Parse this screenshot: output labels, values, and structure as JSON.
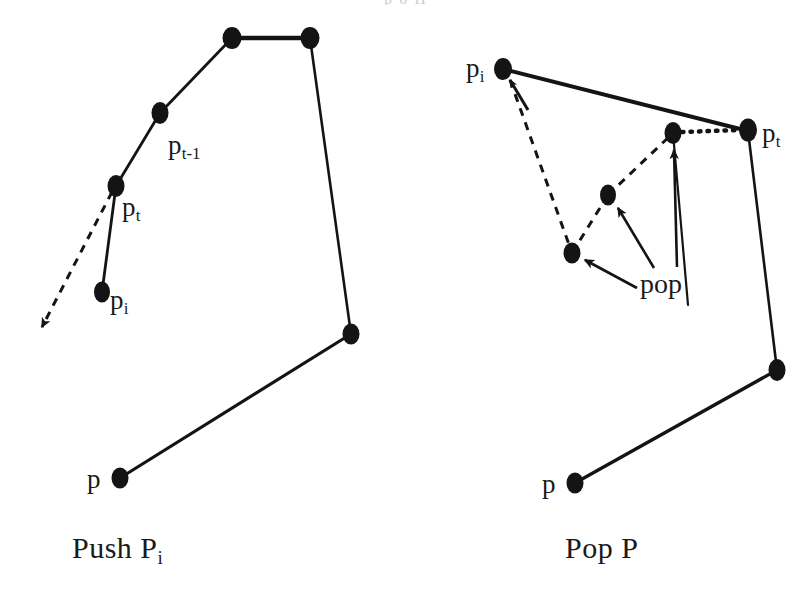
{
  "figure": {
    "type": "geometric-diagram",
    "background_color": "#ffffff",
    "ink_color": "#141414",
    "panels": [
      {
        "id": "push",
        "caption": "Push P",
        "caption_subscript": "i",
        "labels": [
          {
            "id": "p-t-minus-1",
            "base": "p",
            "sub": "t-1"
          },
          {
            "id": "p-t",
            "base": "p",
            "sub": "t"
          },
          {
            "id": "p-i",
            "base": "p",
            "sub": "i"
          },
          {
            "id": "p",
            "base": "p",
            "sub": ""
          }
        ]
      },
      {
        "id": "pop",
        "caption": "Pop P",
        "caption_subscript": "",
        "labels": [
          {
            "id": "p-i",
            "base": "p",
            "sub": "i"
          },
          {
            "id": "p-t",
            "base": "p",
            "sub": "t"
          },
          {
            "id": "p",
            "base": "p",
            "sub": ""
          },
          {
            "id": "pop",
            "base": "pop",
            "sub": ""
          }
        ]
      }
    ]
  },
  "left_panel": {
    "caption_text": "Push P",
    "caption_sub": "i",
    "label_pt_minus_1_base": "p",
    "label_pt_minus_1_sub": "t-1",
    "label_pt_base": "p",
    "label_pt_sub": "t",
    "label_pi_base": "p",
    "label_pi_sub": "i",
    "label_p": "p"
  },
  "right_panel": {
    "caption_text": "Pop P",
    "label_pi_base": "p",
    "label_pi_sub": "i",
    "label_pt_base": "p",
    "label_pt_sub": "t",
    "label_p": "p",
    "label_pop": "pop"
  },
  "top_cropped_text": "p                    o                 H"
}
